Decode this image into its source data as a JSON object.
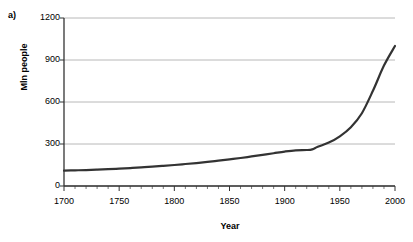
{
  "figure": {
    "panel_label": "a)",
    "background_color": "#ffffff"
  },
  "chart_data": {
    "type": "line",
    "title": "",
    "subtitle": "",
    "panel": "a)",
    "xlabel": "Year",
    "ylabel": "Mln people",
    "xlim": [
      1700,
      2000
    ],
    "ylim": [
      0,
      1200
    ],
    "yticks": [
      0,
      300,
      600,
      900,
      1200
    ],
    "ytick_labels": [
      "0",
      "300",
      "600",
      "900",
      "1200"
    ],
    "xticks": [
      1700,
      1750,
      1800,
      1850,
      1900,
      1950,
      2000
    ],
    "xtick_labels": [
      "1700",
      "1750",
      "1800",
      "1850",
      "1900",
      "1950",
      "2000"
    ],
    "x_minor_tick_interval": 10,
    "grid": {
      "horizontal": true,
      "vertical": false,
      "color": "#a6a6a6"
    },
    "legend": {
      "visible": false,
      "position": "none"
    },
    "line_color": "#333333",
    "line_width": 2.2,
    "markers": "none",
    "series": [
      {
        "name": "Population",
        "x": [
          1700,
          1710,
          1720,
          1730,
          1740,
          1750,
          1760,
          1770,
          1780,
          1790,
          1800,
          1810,
          1820,
          1830,
          1840,
          1850,
          1860,
          1870,
          1880,
          1890,
          1900,
          1910,
          1920,
          1925,
          1930,
          1940,
          1950,
          1960,
          1970,
          1980,
          1990,
          2000
        ],
        "values": [
          110,
          112,
          114,
          117,
          120,
          124,
          128,
          133,
          138,
          144,
          150,
          157,
          164,
          172,
          181,
          190,
          200,
          211,
          222,
          234,
          246,
          255,
          257,
          262,
          280,
          310,
          355,
          420,
          520,
          680,
          860,
          1000
        ]
      }
    ],
    "annotations": []
  },
  "axes_geometry": {
    "plot_left_px": 64,
    "plot_right_px": 395,
    "plot_top_px": 18,
    "plot_bottom_px": 186
  }
}
